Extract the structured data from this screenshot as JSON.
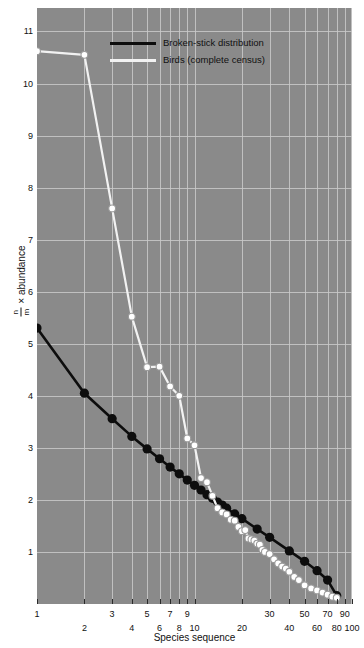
{
  "chart_data": {
    "type": "line",
    "title": "",
    "xlabel": "Species sequence",
    "ylabel_parts": {
      "numerator": "n",
      "denominator": "m",
      "times": "×",
      "rest": "abundance"
    },
    "ylabel": "n/m × abundance",
    "xscale": "log",
    "yscale": "linear",
    "xlim": [
      1,
      100
    ],
    "ylim": [
      0,
      11.45
    ],
    "grid": true,
    "legend_position": "top-center",
    "x_major_ticks": [
      1,
      2,
      3,
      4,
      5,
      6,
      7,
      8,
      9,
      10,
      20,
      30,
      40,
      50,
      60,
      70,
      80,
      90,
      100
    ],
    "x_tick_labels_upper": [
      "1",
      "3",
      "5",
      "7",
      "9",
      "30",
      "50",
      "70",
      "90"
    ],
    "x_tick_labels_lower": [
      "2",
      "4",
      "6",
      "8",
      "10",
      "20",
      "40",
      "60",
      "80",
      "100"
    ],
    "y_ticks": [
      1,
      2,
      3,
      4,
      5,
      6,
      7,
      8,
      9,
      10,
      11
    ],
    "series": [
      {
        "name": "Broken-stick distribution",
        "color": "#0d0d0d",
        "marker": "filled-circle",
        "marker_size": 4.6,
        "points": [
          [
            1,
            5.3
          ],
          [
            2,
            4.05
          ],
          [
            3,
            3.56
          ],
          [
            4,
            3.22
          ],
          [
            5,
            2.98
          ],
          [
            6,
            2.79
          ],
          [
            7,
            2.63
          ],
          [
            8,
            2.5
          ],
          [
            9,
            2.38
          ],
          [
            10,
            2.28
          ],
          [
            11,
            2.19
          ],
          [
            12,
            2.1
          ],
          [
            13,
            2.03
          ],
          [
            14,
            1.96
          ],
          [
            15,
            1.9
          ],
          [
            16,
            1.84
          ],
          [
            18,
            1.73
          ],
          [
            20,
            1.64
          ],
          [
            25,
            1.44
          ],
          [
            30,
            1.28
          ],
          [
            40,
            1.02
          ],
          [
            50,
            0.82
          ],
          [
            60,
            0.64
          ],
          [
            70,
            0.46
          ],
          [
            80,
            0.16
          ]
        ]
      },
      {
        "name": "Birds (complete census)",
        "color": "#f2f2f2",
        "marker": "open-circle",
        "marker_size": 3.4,
        "points": [
          [
            1,
            10.62
          ],
          [
            2,
            10.55
          ],
          [
            3,
            7.6
          ],
          [
            4,
            5.52
          ],
          [
            5,
            4.55
          ],
          [
            6,
            4.56
          ],
          [
            7,
            4.18
          ],
          [
            8,
            4.0
          ],
          [
            9,
            3.18
          ],
          [
            10,
            3.05
          ],
          [
            11,
            2.42
          ],
          [
            12,
            2.34
          ],
          [
            13,
            2.08
          ],
          [
            14,
            1.84
          ],
          [
            15,
            1.76
          ],
          [
            16,
            1.72
          ],
          [
            17,
            1.62
          ],
          [
            18,
            1.6
          ],
          [
            19,
            1.48
          ],
          [
            20,
            1.4
          ],
          [
            21,
            1.42
          ],
          [
            22,
            1.26
          ],
          [
            23,
            1.24
          ],
          [
            24,
            1.22
          ],
          [
            25,
            1.16
          ],
          [
            26,
            1.14
          ],
          [
            27,
            1.04
          ],
          [
            28,
            1.0
          ],
          [
            30,
            0.96
          ],
          [
            32,
            0.86
          ],
          [
            34,
            0.78
          ],
          [
            36,
            0.72
          ],
          [
            38,
            0.68
          ],
          [
            40,
            0.62
          ],
          [
            43,
            0.52
          ],
          [
            46,
            0.46
          ],
          [
            50,
            0.36
          ],
          [
            55,
            0.3
          ],
          [
            60,
            0.26
          ],
          [
            65,
            0.22
          ],
          [
            70,
            0.18
          ],
          [
            75,
            0.14
          ],
          [
            80,
            0.12
          ]
        ]
      }
    ]
  },
  "legend": {
    "items": [
      {
        "label": "Broken-stick distribution",
        "color": "#0d0d0d"
      },
      {
        "label": "Birds (complete census)",
        "color": "#f2f2f2"
      }
    ]
  },
  "style": {
    "panel_background": "#8a8a8a",
    "gridline_color": "#c9c9c9",
    "figure_background": "#ffffff",
    "text_color": "#111111"
  }
}
